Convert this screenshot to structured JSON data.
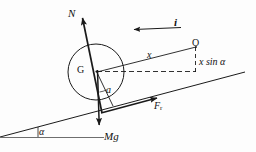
{
  "figure": {
    "kind": "physics-free-body-diagram",
    "background_color": "#fdfdfd",
    "stroke_color": "#1a1a1a",
    "labels": {
      "normal_force": "N",
      "unit_vector": "i",
      "origin_point": "O",
      "distance_x": "x",
      "height_component": "x sin α",
      "center_of_gravity": "G",
      "inner_angle": "a",
      "friction_force_symbol": "F",
      "friction_force_subscript": "r",
      "weight": "Mg",
      "incline_angle": "α"
    },
    "geometry": {
      "incline_start": [
        0,
        137
      ],
      "incline_end": [
        245,
        72
      ],
      "horizontal_ref_start": [
        0,
        137
      ],
      "horizontal_ref_end": [
        104,
        137
      ],
      "angle_arc_vertex": [
        0,
        137
      ],
      "circle_center": [
        96,
        72
      ],
      "circle_radius": 28,
      "contact_point": [
        99,
        111
      ],
      "normal_arrow_tail": [
        101,
        112
      ],
      "normal_arrow_head": [
        81,
        14
      ],
      "weight_arrow_tail": [
        97,
        70
      ],
      "weight_arrow_head": [
        99,
        130
      ],
      "friction_arrow_tail": [
        104,
        112
      ],
      "friction_arrow_head": [
        161,
        96
      ],
      "unit_vector_arrow_tail": [
        181,
        29
      ],
      "unit_vector_arrow_head": [
        130,
        29
      ],
      "origin_point_coords": [
        196,
        47
      ],
      "x_line_from": [
        97,
        72
      ],
      "x_line_to": [
        196,
        47
      ],
      "dashed_horizontal_from": [
        97,
        72
      ],
      "dashed_horizontal_to": [
        196,
        72
      ],
      "dashed_vertical_from": [
        196,
        47
      ],
      "dashed_vertical_to": [
        196,
        72
      ],
      "incline_angle_degrees": 15
    }
  }
}
